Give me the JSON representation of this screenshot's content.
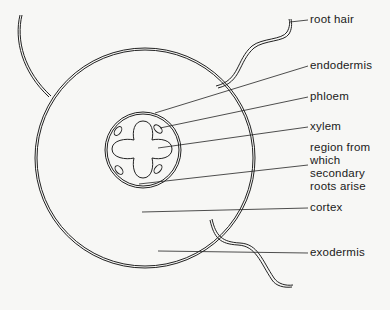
{
  "diagram": {
    "type": "cross-section",
    "labels": {
      "root_hair": "root hair",
      "endodermis": "endodermis",
      "phloem": "phloem",
      "xylem": "xylem",
      "region_line1": "region from",
      "region_line2": "which",
      "region_line3": "secondary",
      "region_line4": "roots arise",
      "cortex": "cortex",
      "exodermis": "exodermis"
    },
    "colors": {
      "stroke": "#222222",
      "background": "#f7f7f5"
    }
  }
}
